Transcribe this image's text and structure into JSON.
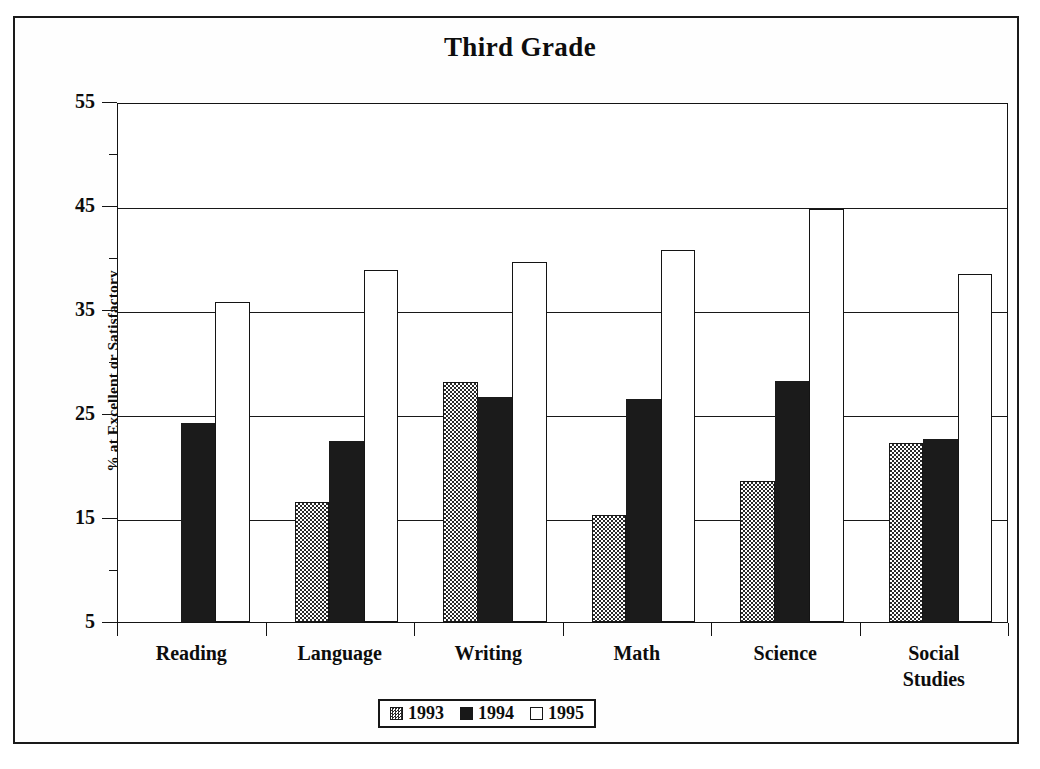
{
  "chart_data": {
    "type": "bar",
    "title": "Third Grade",
    "xlabel": "",
    "ylabel": "% at Excellent or Satisfactory",
    "ylim": [
      5,
      55
    ],
    "ytick_major": [
      5,
      15,
      25,
      35,
      45,
      55
    ],
    "ytick_minor": [
      10,
      20,
      30,
      40,
      50
    ],
    "ytick_labels": [
      "5",
      "15",
      "25",
      "35",
      "45",
      "55"
    ],
    "grid": "horizontal-major",
    "legend_position": "bottom-center",
    "categories": [
      "Reading",
      "Language",
      "Writing",
      "Math",
      "Science",
      "Social Studies"
    ],
    "series": [
      {
        "name": "1993",
        "fill": "checkered-gray",
        "values": [
          null,
          16.5,
          28.1,
          15.3,
          18.6,
          22.2
        ]
      },
      {
        "name": "1994",
        "fill": "solid-black",
        "values": [
          24.1,
          22.4,
          26.6,
          26.4,
          28.2,
          22.6
        ]
      },
      {
        "name": "1995",
        "fill": "white-outline",
        "values": [
          35.8,
          38.8,
          39.6,
          40.8,
          44.7,
          38.5
        ]
      }
    ]
  },
  "legend": {
    "items": [
      {
        "label": "1993",
        "swatch": "checkered-gray-swatch"
      },
      {
        "label": "1994",
        "swatch": "solid-black-swatch"
      },
      {
        "label": "1995",
        "swatch": "white-outline-swatch"
      }
    ]
  },
  "colors": {
    "ink": "#141414",
    "series_1994": "#1b1b1b",
    "series_1995": "#ffffff",
    "background": "#ffffff"
  }
}
